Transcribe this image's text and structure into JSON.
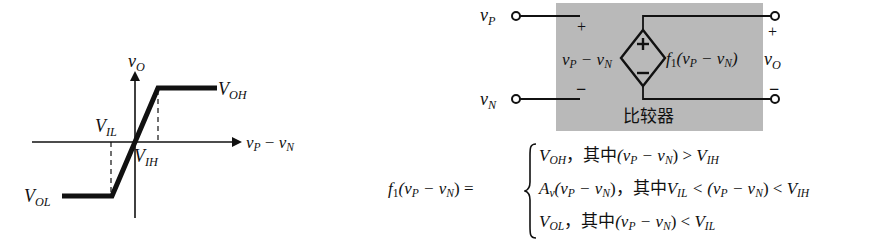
{
  "transfer_curve": {
    "y_axis_label_main": "v",
    "y_axis_label_sub": "O",
    "x_axis_label_1": "v",
    "x_axis_label_1_sub": "P",
    "x_axis_minus": " − ",
    "x_axis_label_2": "v",
    "x_axis_label_2_sub": "N",
    "voh_main": "V",
    "voh_sub": "OH",
    "vol_main": "V",
    "vol_sub": "OL",
    "vil_main": "V",
    "vil_sub": "IL",
    "vih_main": "V",
    "vih_sub": "IH"
  },
  "comparator_circuit": {
    "input_p_main": "v",
    "input_p_sub": "P",
    "input_n_main": "v",
    "input_n_sub": "N",
    "plus_sign": "+",
    "minus_sign": "−",
    "diff_label": "v",
    "diff_label_sub1": "P",
    "diff_minus": " − v",
    "diff_label_sub2": "N",
    "source_plus": "+",
    "source_minus": "−",
    "func_label_f": "f",
    "func_label_f_sub": "1",
    "func_label_args": "(v",
    "func_label_args_sub1": "P",
    "func_label_args_mid": " − v",
    "func_label_args_sub2": "N",
    "func_label_close": ")",
    "output_plus": "+",
    "output_minus": "−",
    "output_main": "v",
    "output_sub": "O",
    "box_caption": "比较器",
    "box_color": "#b9b9b9"
  },
  "equation": {
    "lhs_f": "f",
    "lhs_sub": "1",
    "lhs_args": "(v",
    "lhs_sub_p": "P",
    "lhs_mid": " − v",
    "lhs_sub_n": "N",
    "lhs_close": ") =",
    "cases": [
      {
        "value_main": "V",
        "value_sub": "OH",
        "sep": "，",
        "cond_cn": "其中",
        "cond_a": "(v",
        "cond_a_sub": "P",
        "cond_b": " − v",
        "cond_b_sub": "N",
        "cond_c": ") > ",
        "cond_d": "V",
        "cond_d_sub": "IH"
      },
      {
        "value_main": "A",
        "value_sub": "v",
        "value_rest": "(v",
        "value_rest_sub_p": "P",
        "value_rest_mid": " − v",
        "value_rest_sub_n": "N",
        "value_rest_close": ")",
        "sep": "，",
        "cond_cn": "其中",
        "cond_pre": "V",
        "cond_pre_sub": "IL",
        "cond_lt": " < (v",
        "cond_a_sub": "P",
        "cond_b": " − v",
        "cond_b_sub": "N",
        "cond_c": ") < ",
        "cond_d": "V",
        "cond_d_sub": "IH"
      },
      {
        "value_main": "V",
        "value_sub": "OL",
        "sep": "，",
        "cond_cn": "其中",
        "cond_a": "(v",
        "cond_a_sub": "P",
        "cond_b": " − v",
        "cond_b_sub": "N",
        "cond_c": ") < ",
        "cond_d": "V",
        "cond_d_sub": "IL"
      }
    ]
  }
}
